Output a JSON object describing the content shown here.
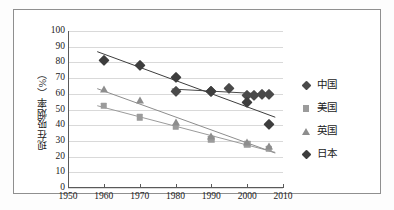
{
  "chart_data": {
    "type": "scatter",
    "title": "",
    "xlabel": "",
    "ylabel": "现在吸烟率（%）",
    "xlim": [
      1950,
      2010
    ],
    "ylim": [
      0,
      100
    ],
    "xticks": [
      1950,
      1960,
      1970,
      1980,
      1990,
      2000,
      2010
    ],
    "yticks": [
      0,
      10,
      20,
      30,
      40,
      50,
      60,
      70,
      80,
      90,
      100
    ],
    "grid": true,
    "legend_position": "right",
    "series": [
      {
        "name": "中国",
        "marker": "diamond",
        "color": "#4a4a4a",
        "trendline": true,
        "points": [
          {
            "x": 1980,
            "y": 62
          },
          {
            "x": 1990,
            "y": 62
          },
          {
            "x": 1995,
            "y": 64
          },
          {
            "x": 2000,
            "y": 59
          },
          {
            "x": 2002,
            "y": 59
          },
          {
            "x": 2004,
            "y": 60
          },
          {
            "x": 2006,
            "y": 60
          }
        ]
      },
      {
        "name": "美国",
        "marker": "square",
        "color": "#9b9b9b",
        "trendline": true,
        "points": [
          {
            "x": 1960,
            "y": 52.5
          },
          {
            "x": 1970,
            "y": 45
          },
          {
            "x": 1980,
            "y": 39
          },
          {
            "x": 1990,
            "y": 31
          },
          {
            "x": 2000,
            "y": 28
          },
          {
            "x": 2006,
            "y": 25
          }
        ]
      },
      {
        "name": "英国",
        "marker": "triangle",
        "color": "#8d8d8d",
        "trendline": true,
        "points": [
          {
            "x": 1960,
            "y": 63
          },
          {
            "x": 1970,
            "y": 56
          },
          {
            "x": 1980,
            "y": 42
          },
          {
            "x": 1990,
            "y": 33
          },
          {
            "x": 2000,
            "y": 29
          },
          {
            "x": 2006,
            "y": 27
          }
        ]
      },
      {
        "name": "日本",
        "marker": "diamond",
        "color": "#3d3d3d",
        "trendline": true,
        "points": [
          {
            "x": 1960,
            "y": 81.5
          },
          {
            "x": 1970,
            "y": 78.5
          },
          {
            "x": 1980,
            "y": 71
          },
          {
            "x": 1990,
            "y": 62
          },
          {
            "x": 2000,
            "y": 55
          },
          {
            "x": 2006,
            "y": 41
          }
        ]
      }
    ]
  },
  "legend": {
    "items": [
      {
        "label": "中国",
        "marker": "diamond",
        "color": "#4a4a4a"
      },
      {
        "label": "美国",
        "marker": "square",
        "color": "#9b9b9b"
      },
      {
        "label": "英国",
        "marker": "triangle",
        "color": "#8d8d8d"
      },
      {
        "label": "日本",
        "marker": "diamond",
        "color": "#3d3d3d"
      }
    ]
  }
}
